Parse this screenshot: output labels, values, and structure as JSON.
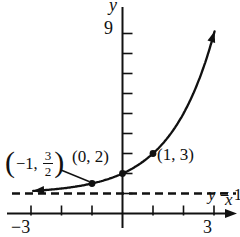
{
  "figure": {
    "bg": "#ffffff",
    "ink": "#111111"
  },
  "chart_data": {
    "type": "line",
    "function": "y = 2^x + 1",
    "xlabel": "x",
    "ylabel": "y",
    "xlim": [
      -3.8,
      3.8
    ],
    "ylim": [
      -1.2,
      10.4
    ],
    "grid": "off",
    "x_axis": {
      "label": "x",
      "ticks": [
        -3,
        -2,
        -1,
        1,
        2,
        3
      ],
      "labeled_ticks": [
        {
          "value": -3,
          "text": "−3"
        },
        {
          "value": 3,
          "text": "3"
        }
      ]
    },
    "y_axis": {
      "label": "y",
      "ticks": [
        1,
        2,
        3,
        4,
        5,
        6,
        7,
        8,
        9
      ],
      "labeled_ticks": [
        {
          "value": 9,
          "text": "9"
        }
      ]
    },
    "series": [
      {
        "name": "y = 2^x + 1",
        "base": 2,
        "offset": 1,
        "x_domain": [
          -2.93,
          3.02
        ],
        "arrows": [
          "lower-left",
          "upper-right"
        ]
      }
    ],
    "marked_points": [
      {
        "x": -1,
        "y": 1.5,
        "label_parts": {
          "open": "(",
          "pre": "−1, ",
          "num": "3",
          "den": "2",
          "close": ")"
        },
        "leader_line": true
      },
      {
        "x": 0,
        "y": 2,
        "label": "(0, 2)"
      },
      {
        "x": 1,
        "y": 3,
        "label": "(1, 3)"
      }
    ],
    "asymptote": {
      "y": 1,
      "style": "dashed",
      "label_var": "y",
      "label_rest": " = 1"
    }
  }
}
